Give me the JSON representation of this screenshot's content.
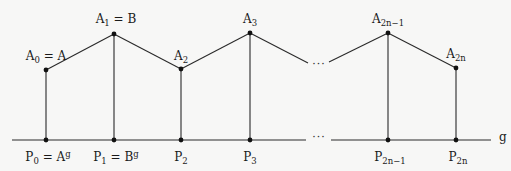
{
  "diagram": {
    "baseline_label": "g",
    "colors": {
      "line": "#2a2a2a",
      "point": "#111111",
      "background": "#f7f7f6"
    },
    "top_points": [
      {
        "id": "A0",
        "base": "A",
        "sub": "0",
        "suffix": " = A",
        "x": 46,
        "y": 70
      },
      {
        "id": "A1",
        "base": "A",
        "sub": "1",
        "suffix": " = B",
        "x": 114,
        "y": 34
      },
      {
        "id": "A2",
        "base": "A",
        "sub": "2",
        "suffix": "",
        "x": 181,
        "y": 69
      },
      {
        "id": "A3",
        "base": "A",
        "sub": "3",
        "suffix": "",
        "x": 250,
        "y": 33
      },
      {
        "id": "A2n-1",
        "base": "A",
        "sub": "2n−1",
        "suffix": "",
        "x": 388,
        "y": 33
      },
      {
        "id": "A2n",
        "base": "A",
        "sub": "2n",
        "suffix": "",
        "x": 456,
        "y": 68
      }
    ],
    "bottom_points": [
      {
        "id": "P0",
        "base": "P",
        "sub": "0",
        "suffix": " = A",
        "sup": "g",
        "x": 46
      },
      {
        "id": "P1",
        "base": "P",
        "sub": "1",
        "suffix": " = B",
        "sup": "g",
        "x": 114
      },
      {
        "id": "P2",
        "base": "P",
        "sub": "2",
        "suffix": "",
        "sup": "",
        "x": 181
      },
      {
        "id": "P3",
        "base": "P",
        "sub": "3",
        "suffix": "",
        "sup": "",
        "x": 250
      },
      {
        "id": "P2n-1",
        "base": "P",
        "sub": "2n−1",
        "suffix": "",
        "sup": "",
        "x": 388
      },
      {
        "id": "P2n",
        "base": "P",
        "sub": "2n",
        "suffix": "",
        "sup": "",
        "x": 456
      }
    ],
    "baseline_y": 140,
    "ellipsis_top": "···",
    "ellipsis_bottom": "···"
  }
}
